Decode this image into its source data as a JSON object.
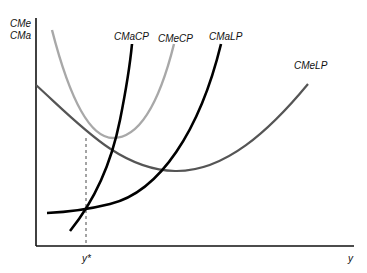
{
  "diagram": {
    "y_axis_label_line1": "CMe",
    "y_axis_label_line2": "CMa",
    "x_axis_label": "y",
    "x_marker_label": "y*",
    "curves": [
      {
        "id": "cmacp",
        "label": "CMaCP",
        "color": "#000000"
      },
      {
        "id": "cmecp",
        "label": "CMeCP",
        "color": "#a8a8a8"
      },
      {
        "id": "cmalp",
        "label": "CMaLP",
        "color": "#000000"
      },
      {
        "id": "cmelp",
        "label": "CMeLP",
        "color": "#555555"
      }
    ]
  }
}
